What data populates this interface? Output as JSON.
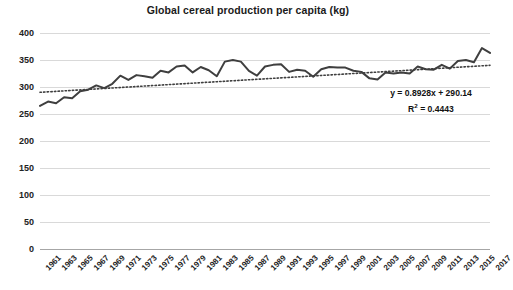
{
  "chart_data": {
    "type": "line",
    "title": "Global cereal production per capita (kg)",
    "xlabel": "",
    "ylabel": "",
    "ylim": [
      0,
      400
    ],
    "ytick_step": 50,
    "yticks": [
      400,
      350,
      300,
      250,
      200,
      150,
      100,
      50,
      0
    ],
    "grid": true,
    "legend": "none",
    "xlim": [
      1961,
      2017
    ],
    "xtick_labels": [
      "1961",
      "1963",
      "1965",
      "1967",
      "1969",
      "1971",
      "1973",
      "1975",
      "1977",
      "1979",
      "1981",
      "1983",
      "1985",
      "1987",
      "1989",
      "1991",
      "1993",
      "1995",
      "1997",
      "1999",
      "2001",
      "2003",
      "2005",
      "2007",
      "2009",
      "2011",
      "2013",
      "2015",
      "2017"
    ],
    "x": [
      1961,
      1962,
      1963,
      1964,
      1965,
      1966,
      1967,
      1968,
      1969,
      1970,
      1971,
      1972,
      1973,
      1974,
      1975,
      1976,
      1977,
      1978,
      1979,
      1980,
      1981,
      1982,
      1983,
      1984,
      1985,
      1986,
      1987,
      1988,
      1989,
      1990,
      1991,
      1992,
      1993,
      1994,
      1995,
      1996,
      1997,
      1998,
      1999,
      2000,
      2001,
      2002,
      2003,
      2004,
      2005,
      2006,
      2007,
      2008,
      2009,
      2010,
      2011,
      2012,
      2013,
      2014,
      2015,
      2016,
      2017
    ],
    "series": [
      {
        "name": "Global cereal production per capita (kg)",
        "color": "#3f3f3f",
        "values": [
          265,
          273,
          270,
          281,
          279,
          292,
          295,
          303,
          298,
          306,
          321,
          313,
          322,
          320,
          317,
          330,
          327,
          338,
          340,
          327,
          337,
          331,
          320,
          347,
          350,
          347,
          330,
          321,
          338,
          341,
          342,
          328,
          332,
          330,
          319,
          333,
          337,
          336,
          336,
          330,
          328,
          316,
          314,
          327,
          325,
          327,
          325,
          338,
          333,
          332,
          341,
          334,
          348,
          350,
          346,
          372,
          363
        ]
      }
    ],
    "trendline": {
      "equation": "y = 0.8928x + 290.14",
      "r2_label": "R",
      "r2_sup": "2",
      "r2_value": " = 0.4443",
      "slope": 0.8928,
      "intercept": 290.14,
      "r2": 0.4443,
      "style": "dotted",
      "color": "#3f3f3f"
    },
    "colors": {
      "gridline": "#d9d9d9",
      "axis": "#a6a6a6",
      "text": "#222222",
      "background": "#ffffff"
    }
  }
}
